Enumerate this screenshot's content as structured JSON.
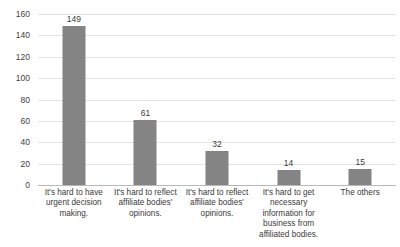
{
  "chart_data": {
    "type": "bar",
    "title": "",
    "subtitle": "",
    "xlabel": "",
    "ylabel": "",
    "categories": [
      "It's hard to have urgent decision making.",
      "It's hard to reflect affiliate bodies' opinions.",
      "It's hard to reflect affiliate bodies' opinions.",
      "It's hard to get necessary information for business from affiliated bodies.",
      "The others"
    ],
    "values": [
      149,
      61,
      32,
      14,
      15
    ],
    "data_labels": [
      "149",
      "61",
      "32",
      "14",
      "15"
    ],
    "ylim": [
      0,
      160
    ],
    "ytick_step": 20,
    "ytick_labels": [
      "0",
      "20",
      "40",
      "60",
      "80",
      "100",
      "120",
      "140",
      "160"
    ],
    "ytick_values": [
      0,
      20,
      40,
      60,
      80,
      100,
      120,
      140,
      160
    ],
    "grid": "horizontal",
    "legend": "none",
    "series": [
      {
        "name": "",
        "values": [
          149,
          61,
          32,
          14,
          15
        ]
      }
    ],
    "colors": {
      "bar_fill": "#848484",
      "gridline": "#e4e4e4",
      "axis_line": "#b9b9b9",
      "text": "#3a3a3a",
      "background": "#ffffff"
    }
  }
}
